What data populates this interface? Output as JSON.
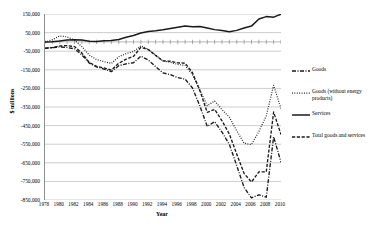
{
  "chart_data": {
    "type": "line",
    "title": "",
    "xlabel": "Year",
    "ylabel": "$ millions",
    "grid": true,
    "legend_position": "right",
    "xlim": [
      1978,
      2010
    ],
    "ylim": [
      -850000,
      150000
    ],
    "y_ticks": [
      150000,
      50000,
      -50000,
      -150000,
      -250000,
      -350000,
      -450000,
      -550000,
      -650000,
      -750000,
      -850000
    ],
    "y_tick_labels": [
      "150,000",
      "50,000",
      "-50,000",
      "-150,000",
      "-250,000",
      "-350,000",
      "-450,000",
      "-550,000",
      "-650,000",
      "-750,000",
      "-850,000"
    ],
    "x_ticks": [
      1978,
      1980,
      1982,
      1984,
      1986,
      1988,
      1990,
      1992,
      1994,
      1996,
      1998,
      2000,
      2002,
      2004,
      2006,
      2008,
      2010
    ],
    "x_tick_labels": [
      "1978",
      "1980",
      "1982",
      "1984",
      "1986",
      "1988",
      "1990",
      "1992",
      "1994",
      "1996",
      "1998",
      "2000",
      "2002",
      "2004",
      "2006",
      "2008",
      "2010"
    ],
    "x": [
      1978,
      1979,
      1980,
      1981,
      1982,
      1983,
      1984,
      1985,
      1986,
      1987,
      1988,
      1989,
      1990,
      1991,
      1992,
      1993,
      1994,
      1995,
      1996,
      1997,
      1998,
      1999,
      2000,
      2001,
      2002,
      2003,
      2004,
      2005,
      2006,
      2007,
      2008,
      2009,
      2010
    ],
    "series": [
      {
        "name": "Goods",
        "style": "dash-dot",
        "color": "#1a1a1a",
        "values": [
          -34000,
          -31000,
          -27000,
          -30000,
          -37000,
          -70000,
          -114000,
          -134000,
          -146000,
          -160000,
          -128000,
          -118000,
          -112000,
          -77000,
          -97000,
          -133000,
          -167000,
          -176000,
          -192000,
          -200000,
          -248000,
          -345000,
          -454000,
          -429000,
          -485000,
          -551000,
          -666000,
          -783000,
          -838000,
          -822000,
          -835000,
          -510000,
          -647000
        ]
      },
      {
        "name": "Goods (without energy products)",
        "style": "dotted",
        "color": "#1a1a1a",
        "values": [
          -2000,
          12000,
          32000,
          27000,
          9000,
          -25000,
          -71000,
          -95000,
          -106000,
          -116000,
          -80000,
          -63000,
          -52000,
          -21000,
          -39000,
          -70000,
          -103000,
          -110000,
          -121000,
          -127000,
          -176000,
          -259000,
          -343000,
          -318000,
          -364000,
          -405000,
          -478000,
          -545000,
          -552000,
          -482000,
          -398000,
          -234000,
          -358000
        ]
      },
      {
        "name": "Services",
        "style": "solid",
        "color": "#1a1a1a",
        "values": [
          -1000,
          1000,
          5000,
          10000,
          12000,
          10000,
          4000,
          2000,
          6000,
          8000,
          13000,
          25000,
          34000,
          48000,
          56000,
          60000,
          65000,
          72000,
          79000,
          86000,
          82000,
          83000,
          75000,
          66000,
          61000,
          55000,
          62000,
          75000,
          85000,
          123000,
          136000,
          133000,
          149000
        ]
      },
      {
        "name": "Total goods and services",
        "style": "dashed",
        "color": "#1a1a1a",
        "values": [
          -35000,
          -30000,
          -22000,
          -20000,
          -25000,
          -60000,
          -110000,
          -132000,
          -140000,
          -152000,
          -115000,
          -93000,
          -78000,
          -29000,
          -41000,
          -73000,
          -102000,
          -104000,
          -113000,
          -114000,
          -166000,
          -262000,
          -379000,
          -363000,
          -424000,
          -496000,
          -604000,
          -708000,
          -753000,
          -699000,
          -699000,
          -377000,
          -498000
        ]
      }
    ]
  },
  "legend": {
    "items": [
      {
        "label": "Goods",
        "key": "dash-dot-line-key"
      },
      {
        "label": "Goods (without energy products)",
        "key": "dotted-line-key"
      },
      {
        "label": "Services",
        "key": "solid-line-key"
      },
      {
        "label": "Total goods and services",
        "key": "dashed-line-key"
      }
    ]
  },
  "axes": {
    "x_title": "Year",
    "y_title": "$ millions"
  }
}
